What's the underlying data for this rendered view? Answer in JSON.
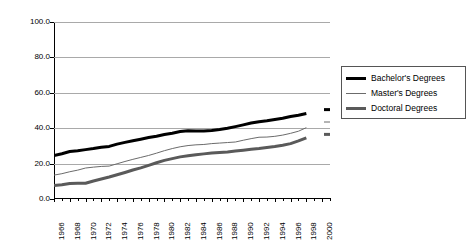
{
  "chart_data": {
    "type": "line",
    "title": "",
    "subtitle": "",
    "xlabel": "",
    "ylabel": "",
    "xlim": [
      1966,
      2001
    ],
    "ylim": [
      0.0,
      100.0
    ],
    "grid": true,
    "legend_position": "right",
    "y_ticks": [
      "0.0",
      "20.0",
      "40.0",
      "60.0",
      "80.0",
      "100.0"
    ],
    "y_tick_values": [
      0.0,
      20.0,
      40.0,
      60.0,
      80.0,
      100.0
    ],
    "x_tick_labels": [
      "1966",
      "1968",
      "1970",
      "1972",
      "1974",
      "1976",
      "1978",
      "1980",
      "1982",
      "1984",
      "1986",
      "1988",
      "1990",
      "1992",
      "1994",
      "1996",
      "1998",
      "2000"
    ],
    "x": [
      1966,
      1967,
      1968,
      1969,
      1970,
      1971,
      1972,
      1973,
      1974,
      1975,
      1976,
      1977,
      1978,
      1979,
      1980,
      1981,
      1982,
      1983,
      1984,
      1985,
      1986,
      1987,
      1988,
      1989,
      1990,
      1991,
      1992,
      1993,
      1994,
      1995,
      1996,
      1997,
      1998,
      2001
    ],
    "series": [
      {
        "name": "Bachelor's Degrees",
        "color": "#000000",
        "width": 3,
        "values": [
          24.5,
          25.6,
          26.8,
          27.3,
          27.9,
          28.5,
          29.2,
          29.7,
          31.0,
          32.0,
          32.9,
          33.8,
          34.7,
          35.5,
          36.4,
          37.2,
          38.1,
          38.6,
          38.4,
          38.4,
          38.7,
          39.3,
          40.0,
          40.9,
          41.9,
          42.9,
          43.7,
          44.2,
          44.9,
          45.6,
          46.6,
          47.3,
          48.3,
          50.5
        ]
      },
      {
        "name": "Master's Degrees",
        "color": "#6b6b6b",
        "width": 1,
        "values": [
          13.5,
          14.3,
          15.4,
          16.3,
          17.5,
          18.0,
          18.4,
          18.6,
          19.9,
          21.2,
          22.4,
          23.5,
          24.6,
          25.9,
          27.3,
          28.5,
          29.5,
          30.2,
          30.6,
          30.8,
          31.3,
          31.6,
          31.9,
          32.2,
          33.2,
          34.1,
          34.9,
          35.0,
          35.4,
          36.1,
          37.1,
          38.3,
          40.3,
          43.5
        ]
      },
      {
        "name": "Doctoral Degrees",
        "color": "#5a5a5a",
        "width": 3,
        "values": [
          7.6,
          8.1,
          8.8,
          8.9,
          8.9,
          10.2,
          11.3,
          12.4,
          13.7,
          15.0,
          16.4,
          17.6,
          19.0,
          20.5,
          21.8,
          22.8,
          23.8,
          24.4,
          25.0,
          25.5,
          26.0,
          26.3,
          26.6,
          27.1,
          27.6,
          28.1,
          28.5,
          29.1,
          29.7,
          30.4,
          31.3,
          32.8,
          34.5,
          36.5
        ]
      }
    ]
  },
  "legend": {
    "items": [
      {
        "label": "Bachelor's Degrees"
      },
      {
        "label": "Master's Degrees"
      },
      {
        "label": "Doctoral Degrees"
      }
    ]
  }
}
